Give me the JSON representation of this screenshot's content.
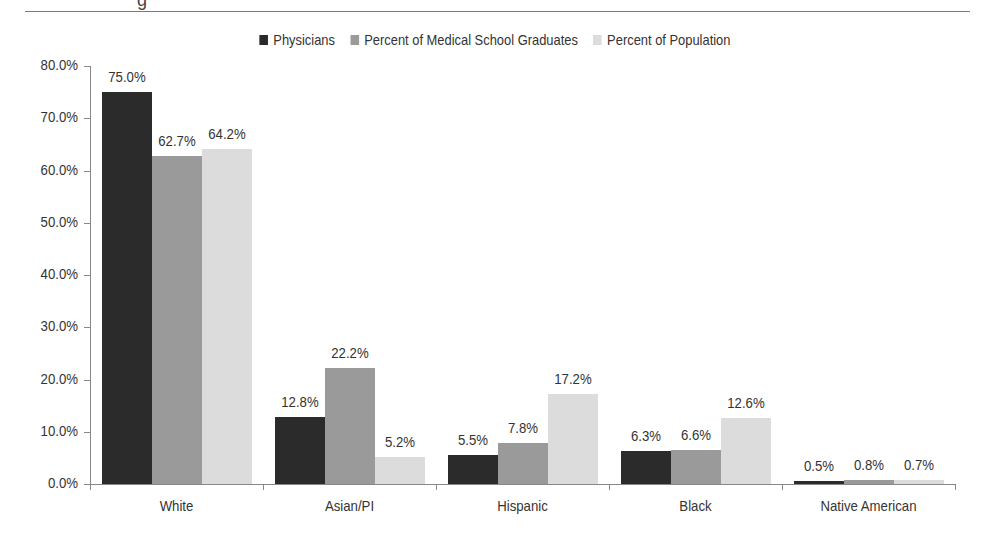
{
  "chart_data": {
    "type": "bar",
    "title": "",
    "xlabel": "",
    "ylabel": "",
    "ylim": [
      0,
      80
    ],
    "yticks": [
      "0.0%",
      "10.0%",
      "20.0%",
      "30.0%",
      "40.0%",
      "50.0%",
      "60.0%",
      "70.0%",
      "80.0%"
    ],
    "grid": false,
    "legend_position": "top",
    "categories": [
      "White",
      "Asian/PI",
      "Hispanic",
      "Black",
      "Native American"
    ],
    "series": [
      {
        "name": "Physicians",
        "color": "#2b2b2b",
        "values": [
          75.0,
          12.8,
          5.5,
          6.3,
          0.5
        ],
        "labels": [
          "75.0%",
          "12.8%",
          "5.5%",
          "6.3%",
          "0.5%"
        ]
      },
      {
        "name": "Percent of Medical School Graduates",
        "color": "#9a9a9a",
        "values": [
          62.7,
          22.2,
          7.8,
          6.6,
          0.8
        ],
        "labels": [
          "62.7%",
          "22.2%",
          "7.8%",
          "6.6%",
          "0.8%"
        ]
      },
      {
        "name": "Percent of Population",
        "color": "#dcdcdc",
        "values": [
          64.2,
          5.2,
          17.2,
          12.6,
          0.7
        ],
        "labels": [
          "64.2%",
          "5.2%",
          "17.2%",
          "12.6%",
          "0.7%"
        ]
      }
    ]
  },
  "header": {
    "partial_title_glyph": "g"
  }
}
